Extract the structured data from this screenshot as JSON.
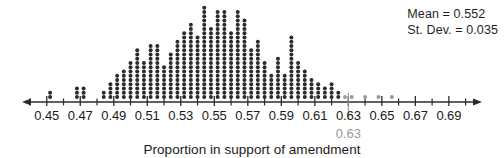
{
  "figure": {
    "axis_title": "Proportion in support of amendment",
    "stats": {
      "mean_label": "Mean = 0.552",
      "stdev_label": "St. Dev. = 0.035"
    },
    "highlight": {
      "value_label": "0.63",
      "value": 0.63,
      "color": "#9a9a9a"
    },
    "colors": {
      "dot": "#2b2b2b",
      "tail_dot": "#9a9a9a",
      "axis": "#2b2b2b",
      "text": "#1a1a1a"
    }
  },
  "chart_data": {
    "type": "dotplot",
    "title": "",
    "xlabel": "Proportion in support of amendment",
    "ylabel": "",
    "xlim": [
      0.44,
      0.705
    ],
    "xtick_labels": [
      "0.45",
      "0.47",
      "0.49",
      "0.51",
      "0.53",
      "0.55",
      "0.57",
      "0.59",
      "0.61",
      "0.63",
      "0.65",
      "0.67",
      "0.69"
    ],
    "xticks": [
      0.45,
      0.47,
      0.49,
      0.51,
      0.53,
      0.55,
      0.57,
      0.59,
      0.61,
      0.63,
      0.65,
      0.67,
      0.69
    ],
    "minor_xticks": [
      0.44,
      0.46,
      0.48,
      0.5,
      0.52,
      0.54,
      0.56,
      0.58,
      0.6,
      0.62,
      0.64,
      0.66,
      0.68,
      0.7
    ],
    "grid": false,
    "legend": "none",
    "dot_value": 1,
    "annotations": [
      {
        "text": "Mean = 0.552",
        "position": "top-right"
      },
      {
        "text": "St. Dev. = 0.035",
        "position": "top-right"
      },
      {
        "text": "0.63",
        "position": "below-axis",
        "x": 0.63,
        "color": "#9a9a9a"
      }
    ],
    "x": [
      0.452,
      0.468,
      0.472,
      0.484,
      0.488,
      0.492,
      0.496,
      0.5,
      0.504,
      0.508,
      0.512,
      0.516,
      0.52,
      0.524,
      0.528,
      0.532,
      0.536,
      0.54,
      0.544,
      0.548,
      0.552,
      0.556,
      0.56,
      0.564,
      0.568,
      0.572,
      0.576,
      0.58,
      0.584,
      0.588,
      0.592,
      0.596,
      0.6,
      0.604,
      0.608,
      0.612,
      0.616,
      0.62,
      0.624,
      0.628,
      0.632,
      0.64,
      0.648,
      0.656
    ],
    "counts": [
      2,
      3,
      3,
      2,
      4,
      6,
      7,
      9,
      12,
      9,
      13,
      13,
      8,
      11,
      14,
      16,
      18,
      15,
      22,
      17,
      21,
      21,
      16,
      21,
      19,
      12,
      14,
      9,
      6,
      10,
      6,
      15,
      9,
      7,
      5,
      4,
      3,
      4,
      2,
      1,
      1,
      1,
      1,
      1
    ],
    "tail_start_index": 39
  }
}
